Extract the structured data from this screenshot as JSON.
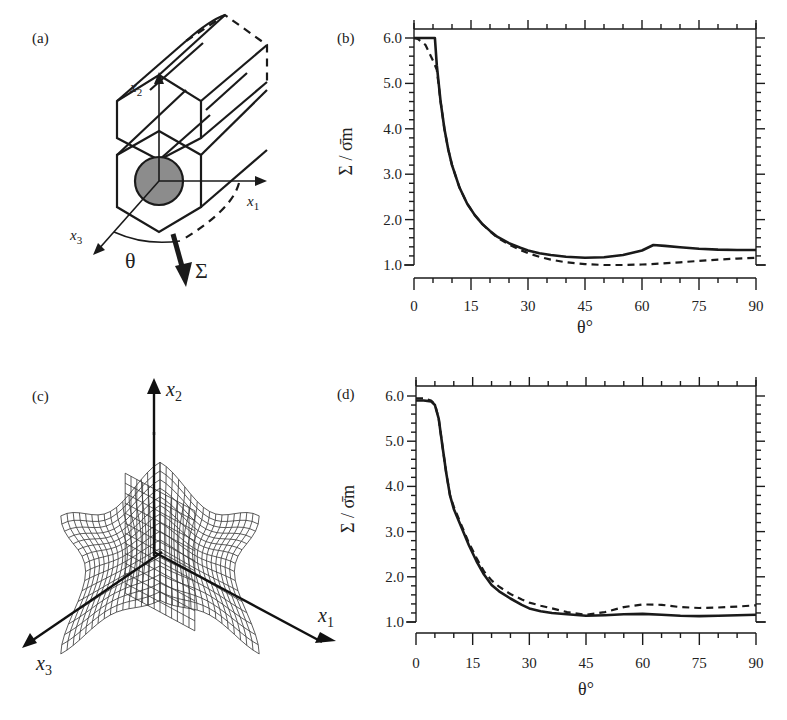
{
  "figure": {
    "panels": {
      "a": {
        "label": "(a)",
        "axes": [
          "x1",
          "x2",
          "x3"
        ],
        "angle_label": "θ",
        "load_label": "Σ"
      },
      "b": {
        "label": "(b)"
      },
      "c": {
        "label": "(c)",
        "axes": [
          "x1",
          "x2",
          "x3"
        ]
      },
      "d": {
        "label": "(d)"
      }
    },
    "line_color": "#1a1a1a"
  },
  "chart_data": [
    {
      "panel": "b",
      "type": "line",
      "title": "",
      "xlabel": "θ°",
      "ylabel": "Σ / σ̄m",
      "xlim": [
        0,
        90
      ],
      "ylim": [
        1.0,
        6.0
      ],
      "x_ticks": [
        "0",
        "15",
        "30",
        "45",
        "60",
        "75",
        "90"
      ],
      "y_ticks": [
        "1.0",
        "2.0",
        "3.0",
        "4.0",
        "5.0",
        "6.0"
      ],
      "grid": false,
      "legend": null,
      "series": [
        {
          "name": "solid",
          "style": "solid",
          "x": [
            0,
            5,
            5.5,
            6,
            7,
            8,
            9,
            10,
            12,
            14,
            16,
            18,
            20,
            22,
            25,
            28,
            30,
            33,
            36,
            40,
            45,
            50,
            55,
            60,
            63,
            66,
            70,
            75,
            80,
            85,
            90
          ],
          "y": [
            6.0,
            6.0,
            6.0,
            5.4,
            4.6,
            4.0,
            3.55,
            3.2,
            2.7,
            2.35,
            2.1,
            1.9,
            1.75,
            1.62,
            1.48,
            1.38,
            1.32,
            1.26,
            1.22,
            1.18,
            1.16,
            1.17,
            1.22,
            1.32,
            1.44,
            1.42,
            1.39,
            1.36,
            1.34,
            1.33,
            1.33
          ]
        },
        {
          "name": "dashed",
          "style": "dashed",
          "x": [
            0,
            1,
            3,
            5,
            6,
            7,
            8,
            9,
            10,
            12,
            14,
            16,
            18,
            20,
            22,
            25,
            28,
            30,
            33,
            36,
            40,
            45,
            50,
            55,
            60,
            65,
            70,
            75,
            80,
            85,
            90
          ],
          "y": [
            6.0,
            5.98,
            5.85,
            5.5,
            5.3,
            4.6,
            4.0,
            3.55,
            3.2,
            2.7,
            2.35,
            2.1,
            1.9,
            1.74,
            1.6,
            1.45,
            1.33,
            1.26,
            1.18,
            1.12,
            1.06,
            1.02,
            1.0,
            1.0,
            1.01,
            1.03,
            1.06,
            1.09,
            1.12,
            1.14,
            1.16
          ]
        }
      ]
    },
    {
      "panel": "d",
      "type": "line",
      "title": "",
      "xlabel": "θ°",
      "ylabel": "Σ / σ̄m",
      "xlim": [
        0,
        90
      ],
      "ylim": [
        1.0,
        6.0
      ],
      "x_ticks": [
        "0",
        "15",
        "30",
        "45",
        "60",
        "75",
        "90"
      ],
      "y_ticks": [
        "1.0",
        "2.0",
        "3.0",
        "4.0",
        "5.0",
        "6.0"
      ],
      "grid": false,
      "legend": null,
      "series": [
        {
          "name": "solid",
          "style": "solid",
          "x": [
            0,
            2,
            4,
            5,
            6,
            7,
            8,
            9,
            10,
            12,
            14,
            16,
            18,
            20,
            22,
            25,
            28,
            30,
            33,
            36,
            40,
            45,
            50,
            55,
            60,
            65,
            70,
            75,
            80,
            85,
            90
          ],
          "y": [
            5.9,
            5.9,
            5.88,
            5.8,
            5.5,
            4.9,
            4.3,
            3.8,
            3.5,
            3.1,
            2.7,
            2.35,
            2.05,
            1.82,
            1.68,
            1.52,
            1.38,
            1.3,
            1.24,
            1.2,
            1.17,
            1.14,
            1.15,
            1.17,
            1.18,
            1.16,
            1.14,
            1.13,
            1.14,
            1.15,
            1.16
          ]
        },
        {
          "name": "dashed",
          "style": "dashed",
          "x": [
            0,
            2,
            4,
            5,
            6,
            7,
            8,
            9,
            10,
            12,
            14,
            16,
            18,
            20,
            22,
            25,
            28,
            30,
            33,
            36,
            40,
            45,
            50,
            55,
            60,
            65,
            70,
            75,
            80,
            85,
            90
          ],
          "y": [
            5.95,
            5.95,
            5.9,
            5.82,
            5.5,
            4.9,
            4.3,
            3.8,
            3.55,
            3.15,
            2.75,
            2.42,
            2.12,
            1.92,
            1.78,
            1.62,
            1.5,
            1.43,
            1.36,
            1.3,
            1.22,
            1.16,
            1.22,
            1.33,
            1.39,
            1.38,
            1.33,
            1.31,
            1.32,
            1.34,
            1.37
          ]
        }
      ]
    }
  ]
}
